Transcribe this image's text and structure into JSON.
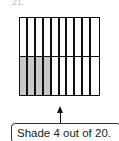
{
  "question": {
    "number": "21."
  },
  "grid": {
    "rows": 2,
    "columns": 10,
    "total_cells": 20,
    "shaded_cells": 4,
    "shaded_row": 2,
    "shaded_columns": [
      1,
      2,
      3,
      4
    ],
    "shade_color": "#c8c8c8",
    "line_color": "#111111"
  },
  "callout": {
    "text": "Shade 4 out of 20."
  }
}
